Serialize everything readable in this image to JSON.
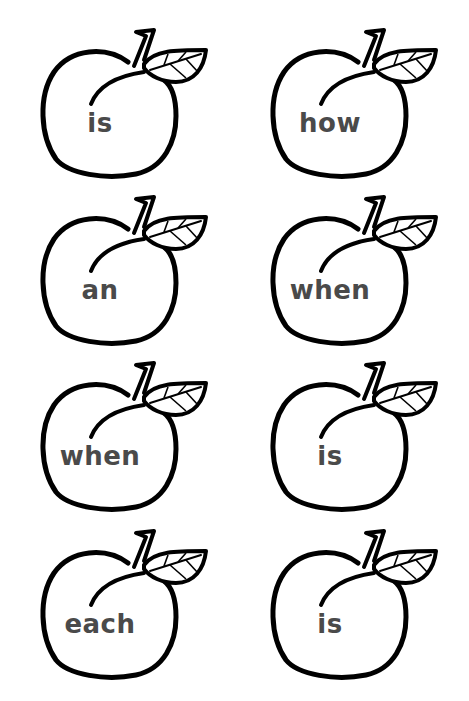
{
  "worksheet": {
    "cards": [
      {
        "word": "is",
        "x": 36,
        "y": 24
      },
      {
        "word": "how",
        "x": 266,
        "y": 24
      },
      {
        "word": "an",
        "x": 36,
        "y": 191
      },
      {
        "word": "when",
        "x": 266,
        "y": 191
      },
      {
        "word": "when",
        "x": 36,
        "y": 357
      },
      {
        "word": "is",
        "x": 266,
        "y": 357
      },
      {
        "word": "each",
        "x": 36,
        "y": 525
      },
      {
        "word": "is",
        "x": 266,
        "y": 525
      }
    ],
    "colors": {
      "outline": "#000000",
      "text": "#4a4a4a",
      "background": "#ffffff"
    },
    "icon": "peach-icon"
  }
}
